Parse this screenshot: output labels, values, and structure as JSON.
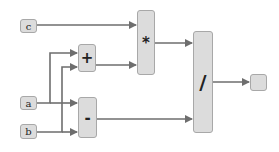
{
  "diagram": {
    "type": "computation-graph",
    "inputs": [
      {
        "id": "c",
        "label": "c"
      },
      {
        "id": "a",
        "label": "a"
      },
      {
        "id": "b",
        "label": "b"
      }
    ],
    "operations": [
      {
        "id": "add",
        "label": "+",
        "inputs": [
          "a",
          "b"
        ]
      },
      {
        "id": "sub",
        "label": "-",
        "inputs": [
          "a",
          "b"
        ]
      },
      {
        "id": "mul",
        "label": "*",
        "inputs": [
          "c",
          "add"
        ]
      },
      {
        "id": "div",
        "label": "/",
        "inputs": [
          "mul",
          "sub"
        ]
      }
    ],
    "output": {
      "id": "out",
      "label": "",
      "inputs": [
        "div"
      ]
    },
    "colors": {
      "node_fill": "#dcdcdc",
      "node_border": "#a8a8a8",
      "edge": "#6e6e6e"
    }
  }
}
